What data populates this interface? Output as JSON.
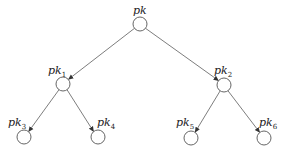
{
  "diagram": {
    "type": "binary-tree",
    "colors": {
      "background": "#ffffff",
      "node_stroke": "#666666",
      "edge": "#6e6e6e",
      "text": "#222222"
    },
    "nodes": [
      {
        "id": "root",
        "label": "pk",
        "subscript": "",
        "cx": 140,
        "cy": 24
      },
      {
        "id": "n1",
        "label": "pk",
        "subscript": "1",
        "cx": 63,
        "cy": 84
      },
      {
        "id": "n2",
        "label": "pk",
        "subscript": "2",
        "cx": 224,
        "cy": 85
      },
      {
        "id": "n3",
        "label": "pk",
        "subscript": "3",
        "cx": 24,
        "cy": 137
      },
      {
        "id": "n4",
        "label": "pk",
        "subscript": "4",
        "cx": 98,
        "cy": 137
      },
      {
        "id": "n5",
        "label": "pk",
        "subscript": "5",
        "cx": 191,
        "cy": 138
      },
      {
        "id": "n6",
        "label": "pk",
        "subscript": "6",
        "cx": 264,
        "cy": 138
      }
    ],
    "edges": [
      {
        "from": "root",
        "to": "n1"
      },
      {
        "from": "root",
        "to": "n2"
      },
      {
        "from": "n1",
        "to": "n3"
      },
      {
        "from": "n1",
        "to": "n4"
      },
      {
        "from": "n2",
        "to": "n5"
      },
      {
        "from": "n2",
        "to": "n6"
      }
    ]
  }
}
